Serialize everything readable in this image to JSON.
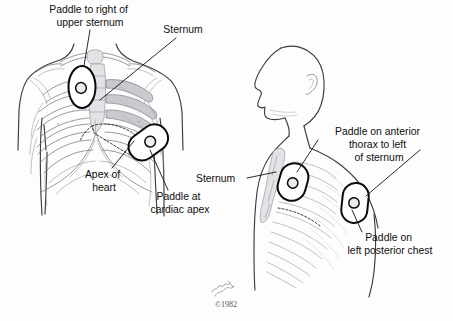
{
  "illustration": {
    "title": "Defibrillator paddle placement",
    "copyright": "©1982",
    "signature": "artist-signature",
    "background_color": "#fdfdfd",
    "ink_color": "#111111"
  },
  "figures": [
    {
      "id": "anterior-chest",
      "view": "anterior thorax, front view",
      "description": "Front view of upper torso showing ribcage, clavicles and sternum with two defibrillator paddles"
    },
    {
      "id": "lateral-chest",
      "view": "lateral thorax with head profile",
      "description": "Side view of head and chest showing ribs, sternum and anterior/posterior paddle placement"
    }
  ],
  "labels": [
    {
      "id": "paddle-right-upper-sternum",
      "figure": "anterior-chest",
      "lines": [
        "Paddle to right of",
        "upper sternum"
      ],
      "x": 90,
      "y": 12
    },
    {
      "id": "sternum-anterior",
      "figure": "anterior-chest",
      "lines": [
        "Sternum"
      ],
      "x": 183,
      "y": 32
    },
    {
      "id": "apex-of-heart",
      "figure": "anterior-chest",
      "lines": [
        "Apex of",
        "heart"
      ],
      "x": 105,
      "y": 177
    },
    {
      "id": "paddle-cardiac-apex",
      "figure": "anterior-chest",
      "lines": [
        "Paddle at",
        "cardiac apex"
      ],
      "x": 180,
      "y": 199
    },
    {
      "id": "sternum-lateral",
      "figure": "lateral-chest",
      "lines": [
        "Sternum"
      ],
      "x": 219,
      "y": 180
    },
    {
      "id": "paddle-anterior-thorax",
      "figure": "lateral-chest",
      "lines": [
        "Paddle on anterior",
        "thorax to left",
        "of sternum"
      ],
      "x": 377,
      "y": 134
    },
    {
      "id": "paddle-left-posterior-chest",
      "figure": "lateral-chest",
      "lines": [
        "Paddle on",
        "left posterior chest"
      ],
      "x": 390,
      "y": 240
    }
  ],
  "paddles": [
    {
      "id": "paddle-upper-right-sternum",
      "figure": "anterior-chest",
      "position": "right of upper sternum",
      "cx": 82,
      "cy": 87
    },
    {
      "id": "paddle-cardiac-apex",
      "figure": "anterior-chest",
      "position": "cardiac apex",
      "cx": 148,
      "cy": 142
    },
    {
      "id": "paddle-anterior-left-sternum",
      "figure": "lateral-chest",
      "position": "anterior thorax left of sternum",
      "cx": 293,
      "cy": 182
    },
    {
      "id": "paddle-posterior-left-chest",
      "figure": "lateral-chest",
      "position": "left posterior chest",
      "cx": 355,
      "cy": 203
    }
  ]
}
